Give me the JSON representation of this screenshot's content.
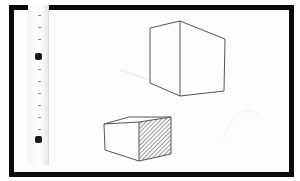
{
  "scene": {
    "description": "Photograph of pencil sketch of two cubes on white paper inside a thick black frame, with a ruler along the left edge",
    "frame_color": "#0a0a0a",
    "paper_color": "#fdfdfd",
    "line_color": "#555555",
    "objects": [
      {
        "name": "upper-cube",
        "style": "outline"
      },
      {
        "name": "lower-cube",
        "style": "one face hatched"
      },
      {
        "name": "ruler",
        "markers": 2
      }
    ]
  }
}
